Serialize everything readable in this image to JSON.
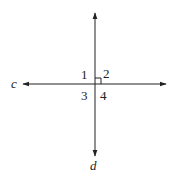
{
  "diagram": {
    "lines": [
      {
        "name": "c",
        "label": "c",
        "orientation": "horizontal"
      },
      {
        "name": "d",
        "label": "d",
        "orientation": "vertical"
      }
    ],
    "angles": [
      {
        "label": "1",
        "position": "top-left"
      },
      {
        "label": "2",
        "position": "top-right"
      },
      {
        "label": "3",
        "position": "bottom-left"
      },
      {
        "label": "4",
        "position": "bottom-right"
      }
    ],
    "right_angle_marker": "angle-2",
    "stroke_color": "#222222"
  }
}
